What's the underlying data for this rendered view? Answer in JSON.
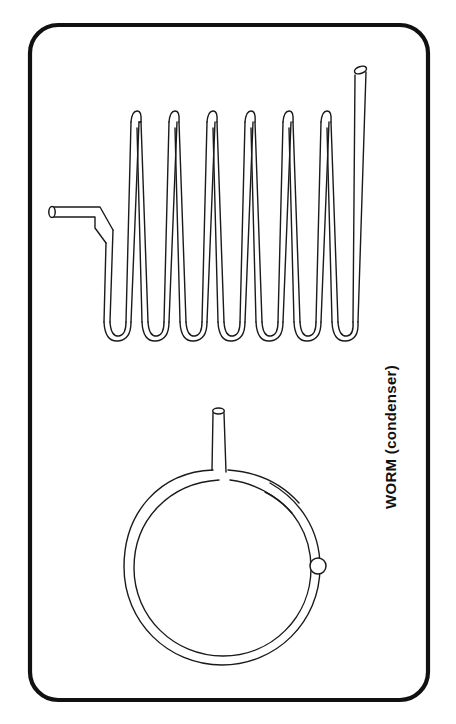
{
  "figure": {
    "caption": "WORM  (condenser)",
    "caption_orientation": "vertical-rotated-90",
    "background_color": "#ffffff",
    "ink_color": "#1a1a1a",
    "frame_color": "#111111"
  },
  "frame": {
    "label": "rounded rectangle border",
    "x": 30,
    "y": 25,
    "width": 398,
    "height": 675,
    "corner_radius": 28,
    "stroke_width": 4.2
  },
  "caption": {
    "text": "WORM  (condenser)",
    "x": 392,
    "y": 435,
    "rotation": -90,
    "font_size": 15,
    "font_weight": "bold"
  },
  "coil_side_view": {
    "name": "zigzag worm coil side view",
    "tube_width": 10,
    "peak_y": 112,
    "valley_y": 335,
    "peak_count": 6,
    "valley_count": 7,
    "peak_xs": [
      135,
      172,
      210,
      248,
      285,
      322
    ],
    "valley_xs": [
      115,
      152,
      190,
      228,
      265,
      303,
      340
    ],
    "horizontal_spacing": 38,
    "inlet": {
      "label": "inlet tube open end",
      "x": 50,
      "y": 211,
      "horizontal_run_to_x": 100,
      "open_end_shape": "ellipse"
    },
    "outlet": {
      "label": "outlet tube open end",
      "x": 360,
      "y": 66,
      "open_end_shape": "slanted ellipse"
    }
  },
  "coil_plan_view": {
    "name": "worm coil ring plan view",
    "center_x": 222,
    "center_y": 567,
    "outer_radius": 98,
    "inner_radius": 88,
    "tube_width": 10,
    "stem": {
      "label": "vertical stem tube",
      "x": 216,
      "top_y": 408,
      "bottom_y": 472,
      "width": 12,
      "open_end_shape": "ellipse"
    },
    "cut_end": {
      "label": "tube cut end seen end-on",
      "x": 319,
      "y": 566,
      "radius": 8
    }
  }
}
